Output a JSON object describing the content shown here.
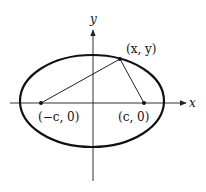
{
  "diagram": {
    "type": "ellipse-with-foci",
    "axes": {
      "x_label": "x",
      "y_label": "y"
    },
    "points": {
      "left_focus": "(−c, 0)",
      "right_focus": "(c, 0)",
      "point_on_ellipse": "(x, y)"
    },
    "colors": {
      "stroke": "#111111",
      "axis": "#333333",
      "background": "#ffffff"
    }
  }
}
